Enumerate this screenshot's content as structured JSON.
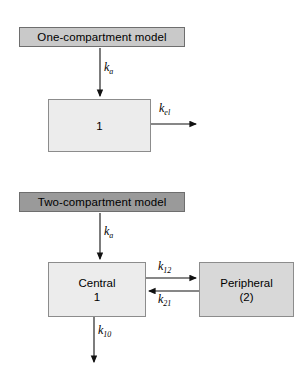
{
  "figure": {
    "background_color": "#ffffff",
    "width": 305,
    "height": 377
  },
  "one_compartment": {
    "title": "One-compartment model",
    "title_fill": "#c9c9c9",
    "compartment": {
      "label": "1",
      "fill": "#ececec"
    },
    "absorption_rate": "k",
    "absorption_rate_sub": "a",
    "elimination_rate": "k",
    "elimination_rate_sub": "el"
  },
  "two_compartment": {
    "title": "Two-compartment model",
    "title_fill": "#9a9a9a",
    "central": {
      "name": "Central",
      "number": "1",
      "fill": "#ececec"
    },
    "peripheral": {
      "name": "Peripheral",
      "number": "(2)",
      "fill": "#d8d8d8"
    },
    "absorption_rate": "k",
    "absorption_rate_sub": "a",
    "transfer_forward": "k",
    "transfer_forward_sub": "12",
    "transfer_back": "k",
    "transfer_back_sub": "21",
    "elimination_rate": "k",
    "elimination_rate_sub": "10"
  }
}
